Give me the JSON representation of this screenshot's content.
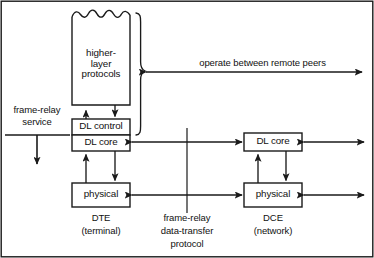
{
  "diagram": {
    "colors": {
      "stroke": "#1a1a1a",
      "fill": "#ffffff",
      "text": "#111111"
    },
    "boxes": [
      {
        "id": "higher-layer",
        "label": "higher-\nlayer\nprotocols",
        "x": 72,
        "y": 12,
        "w": 58,
        "h": 93,
        "torn_top": true
      },
      {
        "id": "dte-dl-control",
        "label": "DL control",
        "x": 72,
        "y": 119,
        "w": 58,
        "h": 16
      },
      {
        "id": "dte-dl-core",
        "label": "DL core",
        "x": 72,
        "y": 135,
        "w": 58,
        "h": 16
      },
      {
        "id": "dte-physical",
        "label": "physical",
        "x": 72,
        "y": 183,
        "w": 58,
        "h": 24
      },
      {
        "id": "dce-dl-core",
        "label": "DL core",
        "x": 244,
        "y": 133,
        "w": 58,
        "h": 18
      },
      {
        "id": "dce-physical",
        "label": "physical",
        "x": 244,
        "y": 183,
        "w": 58,
        "h": 24
      }
    ],
    "captions": [
      {
        "id": "dte-caption",
        "label": "DTE\n(terminal)",
        "x": 72,
        "y": 212,
        "w": 58
      },
      {
        "id": "dce-caption",
        "label": "DCE\n(network)",
        "x": 244,
        "y": 212,
        "w": 58
      }
    ],
    "annotations": [
      {
        "id": "frame-relay-service",
        "label": "frame-relay\nservice",
        "x": 2,
        "y": 104,
        "w": 70
      },
      {
        "id": "operate-between-remote-peers",
        "label": "operate between remote peers",
        "x": 180,
        "y": 58,
        "w": 160
      },
      {
        "id": "frame-relay-data-transfer-protocol",
        "label": "frame-relay\ndata-transfer\nprotocol",
        "x": 148,
        "y": 212,
        "w": 80
      }
    ]
  }
}
